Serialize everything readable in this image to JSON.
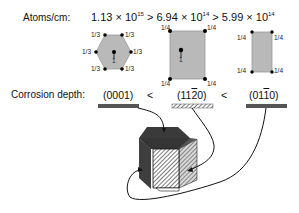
{
  "header": {
    "density_label": "Atoms/cm:",
    "density_formula": {
      "v1": "1.13 × 10",
      "e1": "15",
      "gt1": " > ",
      "v2": "6.94 × 10",
      "e2": "14",
      "gt2": " > ",
      "v3": "5.99 × 10",
      "e3": "14"
    }
  },
  "planes": [
    {
      "name": "basal-hexagon",
      "miller": {
        "pre": "(0001)",
        "bar": "",
        "post": ""
      },
      "fill": "#b9b9b9",
      "fractions": [
        "1/3",
        "1/3",
        "1/3",
        "1/3",
        "1/3",
        "1/3"
      ],
      "center_fraction": "1",
      "bar_style": "solid"
    },
    {
      "name": "a-plane-rectangle",
      "miller": {
        "pre": "(11",
        "bar": "2",
        "post": "0)"
      },
      "fill": "#b9b9b9",
      "fractions": [
        "1/4",
        "1/4",
        "1/4",
        "1/4"
      ],
      "center_fraction": "1",
      "bar_style": "hatched"
    },
    {
      "name": "m-plane-rectangle",
      "miller": {
        "pre": "(01",
        "bar": "1",
        "post": "0)"
      },
      "fill": "#b9b9b9",
      "fractions": [
        "1/4",
        "1/4",
        "1/4",
        "1/4"
      ],
      "center_fraction": "",
      "bar_style": "solid"
    }
  ],
  "corrosion": {
    "label": "Corrosion depth:",
    "lt1": "<",
    "lt2": "<"
  },
  "colors": {
    "plane_fill": "#b9b9b9",
    "plane_stroke": "#8a8a8a",
    "bar_dark": "#555555",
    "prism_dark": "#3a3a3a",
    "atom": "#000000"
  }
}
